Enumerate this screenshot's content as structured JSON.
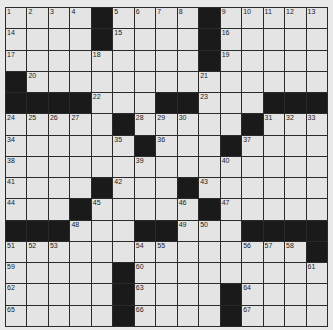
{
  "puzzle": {
    "rows": 15,
    "cols": 15,
    "layout": [
      "....#....#.....",
      "....#....#.....",
      ".........#.....",
      "#..............",
      "####...##...###",
      ".....#.....#...",
      "......#...#....",
      "...............",
      "....#...#......",
      "...#.....#.....",
      "###...##...####",
      "..............#",
      ".....#.........",
      ".....#....#....",
      ".....#....#...."
    ],
    "numbers": {
      "0,0": "1",
      "0,1": "2",
      "0,2": "3",
      "0,3": "4",
      "0,5": "5",
      "0,6": "6",
      "0,7": "7",
      "0,8": "8",
      "0,10": "9",
      "0,11": "10",
      "0,12": "11",
      "0,13": "12",
      "0,14": "13",
      "1,0": "14",
      "1,5": "15",
      "1,10": "16",
      "2,0": "17",
      "2,4": "18",
      "2,10": "19",
      "3,1": "20",
      "3,9": "21",
      "4,4": "22",
      "4,9": "23",
      "5,0": "24",
      "5,1": "25",
      "5,2": "26",
      "5,3": "27",
      "5,6": "28",
      "5,7": "29",
      "5,8": "30",
      "5,12": "31",
      "5,13": "32",
      "5,14": "33",
      "6,0": "34",
      "6,5": "35",
      "6,7": "36",
      "6,11": "37",
      "7,0": "38",
      "7,6": "39",
      "7,10": "40",
      "8,0": "41",
      "8,5": "42",
      "8,9": "43",
      "9,0": "44",
      "9,4": "45",
      "9,8": "46",
      "9,10": "47",
      "10,3": "48",
      "10,8": "49",
      "10,9": "50",
      "11,0": "51",
      "11,1": "52",
      "11,2": "53",
      "11,6": "54",
      "11,7": "55",
      "11,11": "56",
      "11,12": "57",
      "11,13": "58",
      "12,0": "59",
      "12,6": "60",
      "12,14": "61",
      "13,0": "62",
      "13,6": "63",
      "13,11": "64",
      "14,0": "65",
      "14,6": "66",
      "14,11": "67"
    }
  }
}
